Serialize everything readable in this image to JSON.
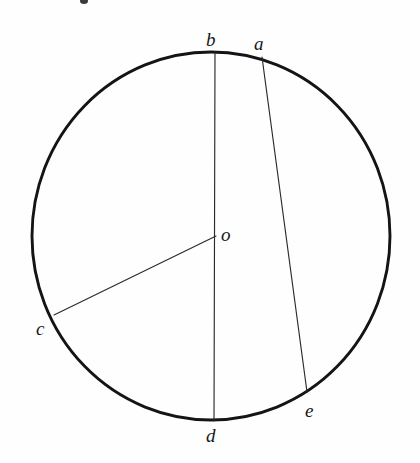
{
  "figure": {
    "kind": "circle-geometry-diagram",
    "background_color": "#fefefe",
    "ink_color": "#141414",
    "width": 420,
    "height": 463
  },
  "circle": {
    "name": "main-circle",
    "center_x": 211,
    "center_y": 236,
    "radius_x": 179,
    "radius_y": 184,
    "stroke_color": "#141414",
    "stroke_width": 2.9
  },
  "points": {
    "a": {
      "label": "a",
      "x": 262,
      "y": 57,
      "label_x": 254,
      "label_y": 50,
      "position": "upper-right-on-circle"
    },
    "b": {
      "label": "b",
      "x": 215,
      "y": 52,
      "label_x": 206,
      "label_y": 46,
      "position": "top-on-circle"
    },
    "c": {
      "label": "c",
      "x": 54,
      "y": 315,
      "label_x": 36,
      "label_y": 335,
      "position": "lower-left-on-circle"
    },
    "d": {
      "label": "d",
      "x": 214,
      "y": 421,
      "label_x": 206,
      "label_y": 442,
      "position": "bottom-on-circle"
    },
    "e": {
      "label": "e",
      "x": 307,
      "y": 392,
      "label_x": 305,
      "label_y": 417,
      "position": "lower-right-on-circle"
    },
    "o": {
      "label": "o",
      "x": 216,
      "y": 236,
      "label_x": 221,
      "label_y": 241,
      "position": "center"
    }
  },
  "segments": [
    {
      "name": "diameter-bd",
      "from": "b",
      "to": "d",
      "x1": 215,
      "y1": 52,
      "x2": 214,
      "y2": 421,
      "kind": "diameter"
    },
    {
      "name": "chord-ae",
      "from": "a",
      "to": "e",
      "x1": 262,
      "y1": 57,
      "x2": 307,
      "y2": 392,
      "kind": "chord"
    },
    {
      "name": "radius-oc",
      "from": "o",
      "to": "c",
      "x1": 216,
      "y1": 236,
      "x2": 54,
      "y2": 315,
      "kind": "radius"
    }
  ],
  "chart_data": {
    "type": "scatter",
    "title": "",
    "xlabel": "",
    "ylabel": "",
    "labels": [
      "a",
      "b",
      "c",
      "d",
      "e",
      "o"
    ],
    "x": [
      262,
      215,
      54,
      214,
      307,
      216
    ],
    "y": [
      57,
      52,
      315,
      421,
      392,
      236
    ],
    "xlim": [
      0,
      420
    ],
    "ylim": [
      463,
      0
    ],
    "grid": false,
    "legend": "none"
  }
}
